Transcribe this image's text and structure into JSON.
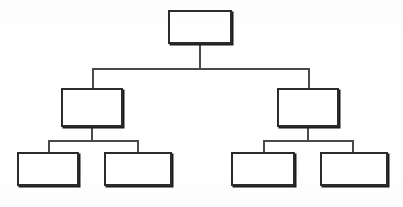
{
  "diagram": {
    "type": "tree",
    "orientation": "top-down",
    "levels": 3,
    "node_count": 7,
    "all_nodes_blank": true,
    "background_color": "#ffffff",
    "box_fill_color": "#ffffff",
    "box_border_color": "#2b2b2b",
    "connector_color": "#4a4a4a",
    "nodes": [
      {
        "id": "root",
        "label": "",
        "level": 1,
        "x": 168,
        "y": 10,
        "width": 64,
        "height": 34
      },
      {
        "id": "mid-left",
        "label": "",
        "level": 2,
        "x": 61,
        "y": 88,
        "width": 62,
        "height": 39
      },
      {
        "id": "mid-right",
        "label": "",
        "level": 2,
        "x": 277,
        "y": 88,
        "width": 62,
        "height": 39
      },
      {
        "id": "leaf-1",
        "label": "",
        "level": 3,
        "x": 17,
        "y": 152,
        "width": 62,
        "height": 34
      },
      {
        "id": "leaf-2",
        "label": "",
        "level": 3,
        "x": 104,
        "y": 152,
        "width": 68,
        "height": 34
      },
      {
        "id": "leaf-3",
        "label": "",
        "level": 3,
        "x": 231,
        "y": 152,
        "width": 64,
        "height": 34
      },
      {
        "id": "leaf-4",
        "label": "",
        "level": 3,
        "x": 320,
        "y": 152,
        "width": 68,
        "height": 34
      }
    ],
    "connectors": [
      {
        "id": "root-stem",
        "from": "root",
        "to": "bus-1",
        "kind": "vertical",
        "x": 199,
        "y": 44,
        "length": 25
      },
      {
        "id": "bus-1",
        "from": "root",
        "to": "mid-row",
        "kind": "horizontal",
        "x": 92,
        "y": 68,
        "length": 218
      },
      {
        "id": "drop-mid-left",
        "from": "bus-1",
        "to": "mid-left",
        "kind": "vertical",
        "x": 92,
        "y": 68,
        "length": 21
      },
      {
        "id": "drop-mid-right",
        "from": "bus-1",
        "to": "mid-right",
        "kind": "vertical",
        "x": 308,
        "y": 68,
        "length": 21
      },
      {
        "id": "mid-left-stem",
        "from": "mid-left",
        "to": "bus-2",
        "kind": "vertical",
        "x": 91,
        "y": 127,
        "length": 14
      },
      {
        "id": "bus-2",
        "from": "mid-left",
        "to": "leaf-row-left",
        "kind": "horizontal",
        "x": 48,
        "y": 140,
        "length": 91
      },
      {
        "id": "drop-leaf-1",
        "from": "bus-2",
        "to": "leaf-1",
        "kind": "vertical",
        "x": 48,
        "y": 140,
        "length": 13
      },
      {
        "id": "drop-leaf-2",
        "from": "bus-2",
        "to": "leaf-2",
        "kind": "vertical",
        "x": 137,
        "y": 140,
        "length": 13
      },
      {
        "id": "mid-right-stem",
        "from": "mid-right",
        "to": "bus-3",
        "kind": "vertical",
        "x": 307,
        "y": 127,
        "length": 14
      },
      {
        "id": "bus-3",
        "from": "mid-right",
        "to": "leaf-row-right",
        "kind": "horizontal",
        "x": 263,
        "y": 140,
        "length": 91
      },
      {
        "id": "drop-leaf-3",
        "from": "bus-3",
        "to": "leaf-3",
        "kind": "vertical",
        "x": 263,
        "y": 140,
        "length": 13
      },
      {
        "id": "drop-leaf-4",
        "from": "bus-3",
        "to": "leaf-4",
        "kind": "vertical",
        "x": 352,
        "y": 140,
        "length": 13
      }
    ]
  }
}
